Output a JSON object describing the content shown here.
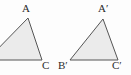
{
  "figure": {
    "background_color": "#fdfdfd",
    "width": 131,
    "height": 75
  },
  "style": {
    "fill_color": "#ebebeb",
    "stroke_color": "#555555",
    "stroke_width": 1,
    "label_color": "#2b2b2b"
  },
  "shapes": [
    {
      "name": "triangle-abc",
      "points": "-13,60 28,18 42,60",
      "clipped_at_left_edge": true,
      "vertices": [
        {
          "label": "A",
          "x": 28,
          "y": 18,
          "visible": true
        },
        {
          "label": "B",
          "x": -13,
          "y": 60,
          "visible": false
        },
        {
          "label": "C",
          "x": 42,
          "y": 60,
          "visible": true
        }
      ]
    },
    {
      "name": "triangle-a-prime-b-prime-c-prime",
      "points": "70,60 103,19 118,60",
      "clipped_at_left_edge": false,
      "vertices": [
        {
          "label": "A′",
          "x": 103,
          "y": 19,
          "visible": true
        },
        {
          "label": "B′",
          "x": 70,
          "y": 60,
          "visible": true
        },
        {
          "label": "C′",
          "x": 118,
          "y": 60,
          "visible": true
        }
      ]
    }
  ],
  "labels": {
    "a": "A",
    "c": "C",
    "a_prime": "A′",
    "b_prime": "B′",
    "c_prime": "C′"
  }
}
